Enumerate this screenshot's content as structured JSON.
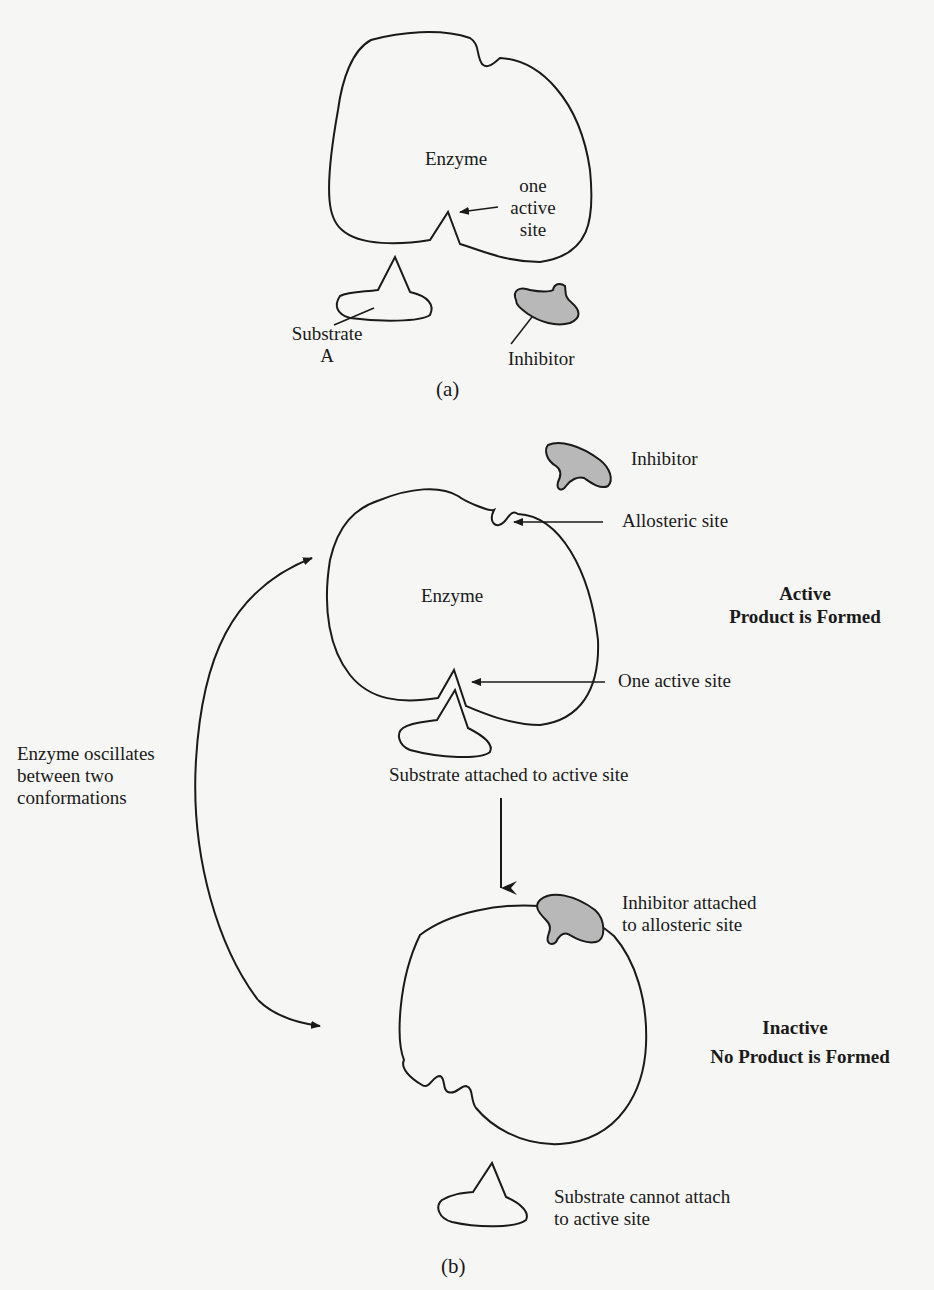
{
  "panel_a": {
    "caption": "(a)",
    "enzyme_label": "Enzyme",
    "active_site_label": [
      "one",
      "active",
      "site"
    ],
    "substrate_label": [
      "Substrate",
      "A"
    ],
    "inhibitor_label": "Inhibitor"
  },
  "panel_b": {
    "caption": "(b)",
    "oscillation_label": [
      "Enzyme oscillates",
      "between two",
      "conformations"
    ],
    "active_state": {
      "inhibitor_label": "Inhibitor",
      "allosteric_site_label": "Allosteric site",
      "enzyme_label": "Enzyme",
      "state_title": "Active",
      "state_subtitle": "Product is Formed",
      "active_site_label": "One active site",
      "substrate_label": "Substrate attached to active site"
    },
    "inactive_state": {
      "inhibitor_label": [
        "Inhibitor attached",
        "to allosteric site"
      ],
      "state_title": "Inactive",
      "state_subtitle": "No Product is Formed",
      "substrate_label": [
        "Substrate cannot attach",
        "to active site"
      ]
    }
  },
  "colors": {
    "background": "#f6f6f4",
    "stroke": "#1a1a1a",
    "inhibitor_fill": "#b8b8b8"
  }
}
